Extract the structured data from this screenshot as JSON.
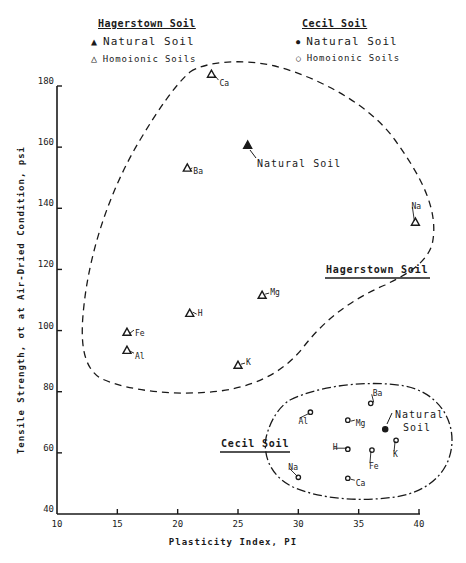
{
  "legend": {
    "hagerstown": {
      "title": "Hagerstown Soil",
      "natural": {
        "symbol": "▲",
        "label": "Natural Soil"
      },
      "homoionic": {
        "symbol": "△",
        "label": "Homoionic Soils"
      }
    },
    "cecil": {
      "title": "Cecil Soil",
      "natural": {
        "symbol": "●",
        "label": "Natural Soil"
      },
      "homoionic": {
        "symbol": "○",
        "label": "Homoionic Soils"
      }
    }
  },
  "axes": {
    "xlabel": "Plasticity Index, PI",
    "ylabel": "Tensile Strength, σt at Air-Dried Condition, psi"
  },
  "regions": {
    "hagerstown_label": "Hagerstown Soil",
    "cecil_label": "Cecil Soil",
    "natural_soil_label": "Natural Soil",
    "cecil_natural_line1": "Natural",
    "cecil_natural_line2": "Soil"
  },
  "chart_data": {
    "type": "scatter",
    "title": "",
    "xlabel": "Plasticity Index, PI",
    "ylabel": "Tensile Strength, σt at Air-Dried Condition, psi",
    "xlim": [
      10,
      40
    ],
    "ylim": [
      40,
      180
    ],
    "xticks": [
      10,
      15,
      20,
      25,
      30,
      35,
      40
    ],
    "yticks": [
      40,
      60,
      80,
      100,
      120,
      140,
      160,
      180
    ],
    "grid": false,
    "legend_position": "top",
    "series": [
      {
        "name": "Hagerstown Soil - Natural Soil",
        "marker": "filled-triangle",
        "points": [
          {
            "label": "Natural Soil",
            "x": 25.8,
            "y": 160.7
          }
        ]
      },
      {
        "name": "Hagerstown Soil - Homoionic Soils",
        "marker": "open-triangle",
        "points": [
          {
            "label": "Ca",
            "x": 22.8,
            "y": 183.9
          },
          {
            "label": "Ba",
            "x": 20.8,
            "y": 153.2
          },
          {
            "label": "Na",
            "x": 39.7,
            "y": 135.5
          },
          {
            "label": "Mg",
            "x": 27.0,
            "y": 111.6
          },
          {
            "label": "H",
            "x": 21.0,
            "y": 105.7
          },
          {
            "label": "Fe",
            "x": 15.8,
            "y": 99.5
          },
          {
            "label": "Al",
            "x": 15.8,
            "y": 93.6
          },
          {
            "label": "K",
            "x": 25.0,
            "y": 88.7
          }
        ]
      },
      {
        "name": "Cecil Soil - Natural Soil",
        "marker": "filled-circle",
        "points": [
          {
            "label": "Natural Soil",
            "x": 37.2,
            "y": 67.7
          }
        ]
      },
      {
        "name": "Cecil Soil - Homoionic Soils",
        "marker": "open-circle",
        "points": [
          {
            "label": "Ba",
            "x": 36.0,
            "y": 76.2
          },
          {
            "label": "Al",
            "x": 31.0,
            "y": 73.3
          },
          {
            "label": "Mg",
            "x": 34.1,
            "y": 70.7
          },
          {
            "label": "K",
            "x": 38.1,
            "y": 64.1
          },
          {
            "label": "H",
            "x": 34.1,
            "y": 61.2
          },
          {
            "label": "Fe",
            "x": 36.1,
            "y": 60.9
          },
          {
            "label": "Na",
            "x": 30.0,
            "y": 52.0
          },
          {
            "label": "Ca",
            "x": 34.1,
            "y": 51.7
          }
        ]
      }
    ],
    "annotations": [
      {
        "text": "Hagerstown Soil",
        "type": "region-boundary",
        "style": "dashed"
      },
      {
        "text": "Cecil Soil",
        "type": "region-boundary",
        "style": "dash-dot"
      }
    ]
  }
}
